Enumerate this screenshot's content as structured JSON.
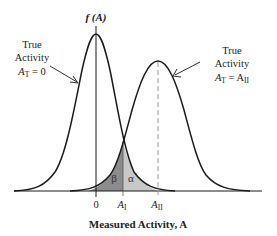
{
  "diagram": {
    "y_axis_label": "f (A)",
    "x_axis_title": "Measured Activity, A",
    "ticks": [
      {
        "label": "0",
        "x": 96
      },
      {
        "label": "A",
        "sub": "I",
        "x": 124
      },
      {
        "label": "A",
        "sub": "II",
        "x": 158
      }
    ],
    "curves": [
      {
        "name": "null-distribution",
        "annotation_lines": [
          "True",
          "Activity",
          "A_T = 0"
        ],
        "annotation": {
          "line1": "True",
          "line2": "Activity",
          "line3_main": "A",
          "line3_sub": "T",
          "line3_rest": " = 0"
        },
        "mean_x": 96,
        "peak_y": 34
      },
      {
        "name": "alternative-distribution",
        "annotation": {
          "line1": "True",
          "line2": "Activity",
          "line3_main": "A",
          "line3_sub": "T",
          "line3_rest": " = A",
          "line3_sub2": "II"
        },
        "mean_x": 158,
        "peak_y": 61
      }
    ],
    "regions": [
      {
        "name": "beta",
        "label": "β",
        "color": "#8c8c8c"
      },
      {
        "name": "alpha",
        "label": "α",
        "color": "#c8c8c8"
      }
    ],
    "colors": {
      "curve": "#1a1a1a",
      "axis": "#1a1a1a",
      "dashed": "#9a9a9a",
      "beta_fill": "#8c8c8c",
      "alpha_fill": "#c8c8c8"
    }
  }
}
